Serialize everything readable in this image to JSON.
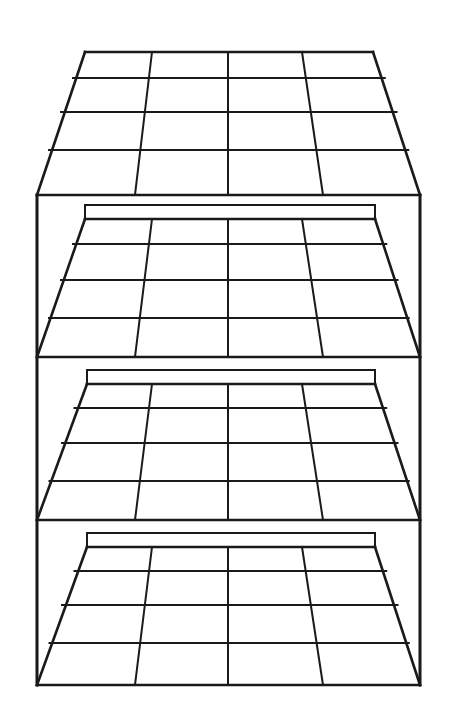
{
  "figure": {
    "style": {
      "background_color": "#ffffff",
      "line_color": "#1a1a1a",
      "outer_line_width": 2.6,
      "grid_line_width": 2.0,
      "shelf_fill": "#ffffff"
    },
    "canvas": {
      "width": 453,
      "height": 717
    }
  },
  "structure": {
    "type": "line-drawing",
    "shelf_count": 4,
    "columns_per_shelf": 4,
    "rows_per_shelf": 4,
    "cells_per_shelf": 16,
    "total_cells": 64,
    "perspective": "one-point, vanishing point above center; shelf surfaces recede upward and rows widen toward the viewer",
    "frame": {
      "left_panel_x": 37,
      "right_panel_x": 420,
      "top_y": 195,
      "bottom_y": 685,
      "back_top_y": 52,
      "back_left_x": 85,
      "back_right_x": 375
    }
  },
  "shelves": [
    {
      "name": "shelf-top",
      "index": 1,
      "label": "Top shelf",
      "back_edge_y": 52,
      "front_edge_y": 195,
      "back_left_x": 85,
      "back_right_x": 373,
      "front_left_x": 37,
      "front_right_x": 420,
      "row_lines_y": [
        52,
        78,
        112,
        150,
        195
      ],
      "back_column_x": [
        85,
        152,
        228,
        302,
        373
      ],
      "front_column_x": [
        37,
        135,
        228,
        323,
        420
      ],
      "riser_visible": false
    },
    {
      "name": "shelf-second",
      "index": 2,
      "label": "Second shelf",
      "back_edge_y": 219,
      "front_edge_y": 357,
      "back_left_x": 85,
      "back_right_x": 375,
      "front_left_x": 37,
      "front_right_x": 420,
      "row_lines_y": [
        219,
        244,
        280,
        318,
        357
      ],
      "back_column_x": [
        85,
        152,
        228,
        302,
        375
      ],
      "front_column_x": [
        37,
        135,
        228,
        323,
        420
      ],
      "riser_top_y": 205,
      "riser_visible": true
    },
    {
      "name": "shelf-third",
      "index": 3,
      "label": "Third shelf",
      "back_edge_y": 384,
      "front_edge_y": 520,
      "back_left_x": 87,
      "back_right_x": 375,
      "front_left_x": 37,
      "front_right_x": 420,
      "row_lines_y": [
        384,
        408,
        443,
        481,
        520
      ],
      "back_column_x": [
        87,
        152,
        228,
        302,
        375
      ],
      "front_column_x": [
        37,
        135,
        228,
        323,
        420
      ],
      "riser_top_y": 370,
      "riser_visible": true
    },
    {
      "name": "shelf-bottom",
      "index": 4,
      "label": "Bottom shelf",
      "back_edge_y": 547,
      "front_edge_y": 685,
      "back_left_x": 87,
      "back_right_x": 375,
      "front_left_x": 37,
      "front_right_x": 420,
      "row_lines_y": [
        547,
        571,
        605,
        643,
        685
      ],
      "back_column_x": [
        87,
        152,
        228,
        302,
        375
      ],
      "front_column_x": [
        37,
        135,
        228,
        323,
        420
      ],
      "riser_top_y": 533,
      "riser_visible": true
    }
  ]
}
